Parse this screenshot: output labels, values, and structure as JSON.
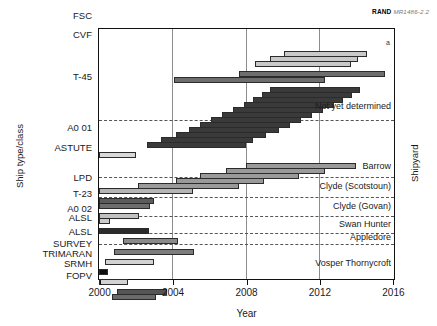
{
  "figure": {
    "credit_org": "RAND",
    "credit_doc": "MR1486-2.2",
    "footnote_marker": "a"
  },
  "axes": {
    "x_title": "Year",
    "y_title_left": "Ship type/class",
    "y_title_right": "Shipyard",
    "x_ticks": [
      "2000",
      "2004",
      "2008",
      "2012",
      "2016"
    ],
    "x_min": 2000,
    "x_max": 2016
  },
  "categories": [
    {
      "label": "FSC",
      "y": 10
    },
    {
      "label": "CVF",
      "y": 29
    },
    {
      "label": "T-45",
      "y": 71
    },
    {
      "label": "A0 01",
      "y": 122
    },
    {
      "label": "ASTUTE",
      "y": 142
    },
    {
      "label": "LPD",
      "y": 172
    },
    {
      "label": "T-23",
      "y": 188
    },
    {
      "label": "A0 02",
      "y": 203
    },
    {
      "label": "ALSL",
      "y": 212
    },
    {
      "label": "ALSL",
      "y": 226
    },
    {
      "label": "SURVEY",
      "y": 238
    },
    {
      "label": "TRIMARAN",
      "y": 248
    },
    {
      "label": "SRMH",
      "y": 258
    },
    {
      "label": "FOPV",
      "y": 270
    }
  ],
  "shipyards": [
    {
      "label": "Not yet determined",
      "y": 105
    },
    {
      "label": "Barrow",
      "y": 165
    },
    {
      "label": "Clyde (Scotstoun)",
      "y": 185
    },
    {
      "label": "Clyde (Govan)",
      "y": 205
    },
    {
      "label": "Swan Hunter",
      "y": 223
    },
    {
      "label": "Appledore",
      "y": 236
    },
    {
      "label": "Vosper Thornycroft",
      "y": 262
    }
  ],
  "separators_y": [
    119,
    176,
    196,
    215,
    232,
    243
  ],
  "chart_data": {
    "type": "bar",
    "orientation": "horizontal-gantt",
    "title": "",
    "xlabel": "Year",
    "ylabel": "Ship type/class",
    "ylabel_right": "Shipyard",
    "xlim": [
      2000,
      2016
    ],
    "xticks": [
      2000,
      2004,
      2008,
      2012,
      2016
    ],
    "grid": "vertical-at-ticks",
    "legend": "none",
    "bars": [
      {
        "group": "FSC",
        "start": 2010.1,
        "end": 2014.6,
        "row": 4,
        "shade": "#c9c9c9"
      },
      {
        "group": "FSC",
        "start": 2009.3,
        "end": 2014.1,
        "row": 5,
        "shade": "#c9c9c9"
      },
      {
        "group": "FSC",
        "start": 2008.5,
        "end": 2013.7,
        "row": 6,
        "shade": "#c9c9c9"
      },
      {
        "group": "CVF",
        "start": 2007.6,
        "end": 2015.6,
        "row": 8,
        "shade": "#6e6e6e"
      },
      {
        "group": "CVF",
        "start": 2004.1,
        "end": 2012.3,
        "row": 9,
        "shade": "#6e6e6e"
      },
      {
        "group": "T-45",
        "start": 2009.3,
        "end": 2014.2,
        "row": 11,
        "shade": "#3a3a3a"
      },
      {
        "group": "T-45",
        "start": 2008.9,
        "end": 2013.8,
        "row": 12,
        "shade": "#3a3a3a"
      },
      {
        "group": "T-45",
        "start": 2008.4,
        "end": 2013.3,
        "row": 13,
        "shade": "#3a3a3a"
      },
      {
        "group": "T-45",
        "start": 2007.9,
        "end": 2012.8,
        "row": 14,
        "shade": "#3a3a3a"
      },
      {
        "group": "T-45",
        "start": 2007.3,
        "end": 2012.2,
        "row": 15,
        "shade": "#3a3a3a"
      },
      {
        "group": "T-45",
        "start": 2006.7,
        "end": 2011.6,
        "row": 16,
        "shade": "#3a3a3a"
      },
      {
        "group": "T-45",
        "start": 2006.1,
        "end": 2011.0,
        "row": 17,
        "shade": "#3a3a3a"
      },
      {
        "group": "T-45",
        "start": 2005.5,
        "end": 2010.4,
        "row": 18,
        "shade": "#3a3a3a"
      },
      {
        "group": "T-45",
        "start": 2004.9,
        "end": 2009.8,
        "row": 19,
        "shade": "#3a3a3a"
      },
      {
        "group": "T-45",
        "start": 2004.2,
        "end": 2009.1,
        "row": 20,
        "shade": "#3a3a3a"
      },
      {
        "group": "T-45",
        "start": 2003.4,
        "end": 2008.4,
        "row": 21,
        "shade": "#3a3a3a"
      },
      {
        "group": "T-45",
        "start": 2002.6,
        "end": 2008.0,
        "row": 22,
        "shade": "#3a3a3a"
      },
      {
        "group": "A0 01",
        "start": 2000.0,
        "end": 2002.0,
        "row": 24,
        "shade": "#d8d8d8"
      },
      {
        "group": "ASTUTE",
        "start": 2008.0,
        "end": 2014.0,
        "row": 26,
        "shade": "#9a9a9a"
      },
      {
        "group": "ASTUTE",
        "start": 2006.9,
        "end": 2012.3,
        "row": 27,
        "shade": "#9a9a9a"
      },
      {
        "group": "ASTUTE",
        "start": 2005.5,
        "end": 2010.9,
        "row": 28,
        "shade": "#9a9a9a"
      },
      {
        "group": "ASTUTE",
        "start": 2004.2,
        "end": 2009.0,
        "row": 29,
        "shade": "#9a9a9a"
      },
      {
        "group": "ASTUTE",
        "start": 2002.1,
        "end": 2007.6,
        "row": 30,
        "shade": "#9a9a9a"
      },
      {
        "group": "ASTUTE",
        "start": 2000.0,
        "end": 2005.1,
        "row": 31,
        "shade": "#b5b5b5"
      },
      {
        "group": "LPD",
        "start": 2000.0,
        "end": 2003.0,
        "row": 33,
        "shade": "#5c5c5c"
      },
      {
        "group": "LPD",
        "start": 2000.0,
        "end": 2002.8,
        "row": 34,
        "shade": "#6e6e6e"
      },
      {
        "group": "T-23",
        "start": 2000.0,
        "end": 2002.2,
        "row": 36,
        "shade": "#c2c2c2"
      },
      {
        "group": "T-23",
        "start": 2000.0,
        "end": 2000.6,
        "row": 37,
        "shade": "#cccccc"
      },
      {
        "group": "A0 02",
        "start": 2000.0,
        "end": 2002.7,
        "row": 39,
        "shade": "#2b2b2b"
      },
      {
        "group": "ALSL",
        "start": 2001.3,
        "end": 2004.3,
        "row": 41,
        "shade": "#8a8a8a"
      },
      {
        "group": "ALSL",
        "start": 2000.8,
        "end": 2005.2,
        "row": 43,
        "shade": "#7d7d7d"
      },
      {
        "group": "SURVEY",
        "start": 2000.3,
        "end": 2003.0,
        "row": 45,
        "shade": "#d2d2d2"
      },
      {
        "group": "TRIMARAN",
        "start": 2000.0,
        "end": 2000.5,
        "row": 47,
        "shade": "#0d0d0d"
      },
      {
        "group": "SRMH",
        "start": 2000.0,
        "end": 2001.6,
        "row": 49,
        "shade": "#d2d2d2"
      },
      {
        "group": "FOPV",
        "start": 2001.0,
        "end": 2003.7,
        "row": 51,
        "shade": "#555555"
      },
      {
        "group": "FOPV",
        "start": 2000.7,
        "end": 2003.1,
        "row": 52,
        "shade": "#6a6a6a"
      }
    ]
  }
}
